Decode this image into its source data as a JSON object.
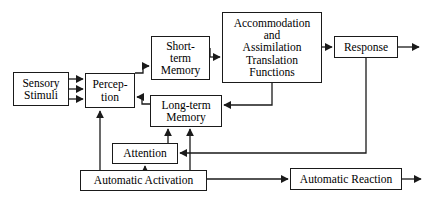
{
  "diagram": {
    "type": "flowchart",
    "canvas": {
      "width": 429,
      "height": 199,
      "background": "#ffffff"
    },
    "stroke_color": "#1a1a1a",
    "nodes": [
      {
        "id": "sensory-stimuli",
        "label": "Sensory\nStimuli"
      },
      {
        "id": "perception",
        "label": "Percep-\ntion"
      },
      {
        "id": "short-term",
        "label": "Short-\nterm\nMemory"
      },
      {
        "id": "long-term",
        "label": "Long-term\nMemory"
      },
      {
        "id": "accommodation",
        "label": "Accommodation\nand\nAssimilation\nTranslation\nFunctions"
      },
      {
        "id": "response",
        "label": "Response"
      },
      {
        "id": "attention",
        "label": "Attention"
      },
      {
        "id": "auto-activation",
        "label": "Automatic Activation"
      },
      {
        "id": "auto-reaction",
        "label": "Automatic Reaction"
      }
    ],
    "edges": [
      {
        "from": "sensory-stimuli",
        "to": "perception",
        "note": "three parallel arrows"
      },
      {
        "from": "perception",
        "to": "short-term",
        "note": "arrow right"
      },
      {
        "from": "short-term",
        "to": "accommodation",
        "note": "arrow right"
      },
      {
        "from": "accommodation",
        "to": "response",
        "note": "arrow right"
      },
      {
        "from": "response",
        "to": "exit",
        "note": "arrow out right"
      },
      {
        "from": "long-term",
        "to": "perception",
        "note": "arrow left"
      },
      {
        "from": "accommodation",
        "to": "long-term",
        "note": "down then left into right side"
      },
      {
        "from": "response",
        "to": "attention",
        "note": "down then left"
      },
      {
        "from": "attention",
        "to": "long-term",
        "note": "arrow up"
      },
      {
        "from": "auto-activation",
        "to": "long-term",
        "note": "arrow up"
      },
      {
        "from": "auto-activation",
        "to": "perception",
        "note": "arrow up"
      },
      {
        "from": "auto-activation",
        "to": "attention",
        "note": "arrow up"
      },
      {
        "from": "auto-activation",
        "to": "auto-reaction",
        "note": "arrow right"
      },
      {
        "from": "auto-reaction",
        "to": "exit",
        "note": "arrow out right"
      }
    ]
  }
}
